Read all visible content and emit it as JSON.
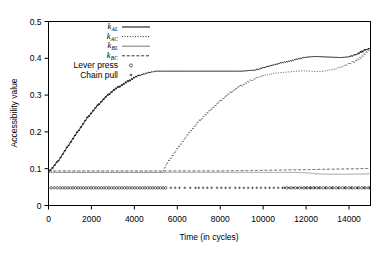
{
  "chart_data": {
    "type": "line",
    "title": "",
    "xlabel": "Time (in cycles)",
    "ylabel": "Accessibility value",
    "xlim": [
      0,
      15000
    ],
    "ylim": [
      0,
      0.5
    ],
    "xticks": [
      0,
      2000,
      4000,
      6000,
      8000,
      10000,
      12000,
      14000
    ],
    "xticklabels": [
      "0",
      "2000",
      "4000",
      "6000",
      "8000",
      "10000",
      "12000",
      "14000"
    ],
    "yticks": [
      0,
      0.1,
      0.2,
      0.3,
      0.4,
      0.5
    ],
    "yticklabels": [
      "0",
      "0.1",
      "0.2",
      "0.3",
      "0.4",
      "0.5"
    ],
    "grid": false,
    "legend_position": "top-center",
    "legend": [
      {
        "name": "k_AL",
        "base": "k",
        "sub": "AL",
        "style": "solid",
        "color": "#000000"
      },
      {
        "name": "k_AC",
        "base": "k",
        "sub": "AC",
        "style": "dotted",
        "color": "#000000"
      },
      {
        "name": "k_BL",
        "base": "k",
        "sub": "BL",
        "style": "solid-thin",
        "color": "#555555"
      },
      {
        "name": "k_BC",
        "base": "k",
        "sub": "BC",
        "style": "dashed",
        "color": "#333333"
      },
      {
        "name": "Lever press",
        "label": "Lever press",
        "style": "marker-circle",
        "marker": "o",
        "color": "#000000"
      },
      {
        "name": "Chain pull",
        "label": "Chain pull",
        "style": "marker-plus",
        "marker": "+",
        "color": "#000000"
      }
    ],
    "series": [
      {
        "name": "k_AL",
        "style": "solid",
        "x": [
          0,
          200,
          400,
          600,
          800,
          1000,
          1200,
          1400,
          1600,
          1800,
          2000,
          2200,
          2400,
          2600,
          2800,
          3000,
          3200,
          3400,
          3600,
          3800,
          4000,
          4200,
          4400,
          4600,
          4800,
          5000,
          5300,
          6000,
          7000,
          8000,
          9000,
          9600,
          10000,
          10400,
          10800,
          11200,
          11600,
          12000,
          12400,
          12800,
          13200,
          13600,
          14000,
          14400,
          14800,
          15000
        ],
        "y": [
          0.092,
          0.103,
          0.118,
          0.134,
          0.152,
          0.17,
          0.187,
          0.204,
          0.221,
          0.238,
          0.252,
          0.266,
          0.279,
          0.291,
          0.302,
          0.312,
          0.32,
          0.327,
          0.334,
          0.341,
          0.348,
          0.353,
          0.357,
          0.36,
          0.363,
          0.365,
          0.365,
          0.365,
          0.365,
          0.365,
          0.365,
          0.368,
          0.374,
          0.381,
          0.387,
          0.392,
          0.398,
          0.403,
          0.405,
          0.404,
          0.403,
          0.402,
          0.404,
          0.412,
          0.424,
          0.428
        ]
      },
      {
        "name": "k_AC",
        "style": "dotted",
        "x": [
          0,
          1000,
          2000,
          3000,
          4000,
          5000,
          5300,
          5500,
          5800,
          6100,
          6400,
          6700,
          7000,
          7300,
          7600,
          7900,
          8200,
          8500,
          8800,
          9100,
          9400,
          9700,
          10000,
          10300,
          10600,
          11000,
          11400,
          11800,
          12200,
          12600,
          13000,
          13400,
          13800,
          14200,
          14600,
          15000
        ],
        "y": [
          0.09,
          0.09,
          0.09,
          0.09,
          0.09,
          0.09,
          0.09,
          0.112,
          0.138,
          0.162,
          0.186,
          0.208,
          0.228,
          0.246,
          0.263,
          0.279,
          0.294,
          0.308,
          0.32,
          0.33,
          0.339,
          0.347,
          0.353,
          0.357,
          0.36,
          0.362,
          0.364,
          0.366,
          0.365,
          0.364,
          0.366,
          0.372,
          0.38,
          0.39,
          0.404,
          0.428
        ]
      },
      {
        "name": "k_BL",
        "style": "solid-thin",
        "x": [
          0,
          2000,
          4000,
          6000,
          8000,
          10000,
          11500,
          12000,
          12500,
          13000,
          14000,
          15000
        ],
        "y": [
          0.09,
          0.09,
          0.09,
          0.09,
          0.09,
          0.09,
          0.09,
          0.089,
          0.086,
          0.085,
          0.085,
          0.086
        ]
      },
      {
        "name": "k_BC",
        "style": "dashed",
        "x": [
          0,
          2000,
          4000,
          6000,
          8000,
          9500,
          10500,
          11500,
          12500,
          13500,
          14500,
          15000
        ],
        "y": [
          0.094,
          0.094,
          0.094,
          0.094,
          0.094,
          0.095,
          0.096,
          0.097,
          0.098,
          0.099,
          0.1,
          0.101
        ]
      }
    ],
    "event_markers": [
      {
        "name": "Lever press",
        "marker": "o",
        "y": 0.048,
        "x": [
          120,
          260,
          400,
          540,
          660,
          780,
          900,
          1020,
          1140,
          1260,
          1380,
          1500,
          1620,
          1740,
          1860,
          1980,
          2100,
          2220,
          2340,
          2460,
          2580,
          2700,
          2820,
          2940,
          3060,
          3180,
          3300,
          3420,
          3540,
          3660,
          3780,
          3900,
          4020,
          4140,
          4260,
          4380,
          4500,
          4620,
          4740,
          4860,
          4980,
          5100,
          5220,
          5340,
          5460,
          11100,
          11300,
          11500,
          11700,
          11900,
          12050,
          12200,
          12350,
          12500,
          12650,
          12800,
          12950,
          13100,
          13250,
          13400,
          13550,
          13700,
          13850,
          14000,
          14150,
          14300,
          14450,
          14600,
          14750,
          14900
        ]
      },
      {
        "name": "Chain pull",
        "marker": "+",
        "y": 0.048,
        "x": [
          5700,
          5900,
          6100,
          6350,
          6600,
          6850,
          7000,
          7200,
          7400,
          7600,
          7850,
          8050,
          8250,
          8450,
          8700,
          8900,
          9100,
          9300,
          9500,
          9700,
          9900,
          10100,
          10300,
          10500,
          10700,
          10900,
          11000,
          11200,
          11400,
          11600,
          11800,
          12000,
          12200,
          12400,
          12600,
          12900,
          13200,
          13500,
          13800,
          14100,
          14400,
          14700,
          14950
        ]
      }
    ]
  },
  "axes": {
    "ylabel": "Accessibility value",
    "xlabel": "Time (in cycles)"
  }
}
